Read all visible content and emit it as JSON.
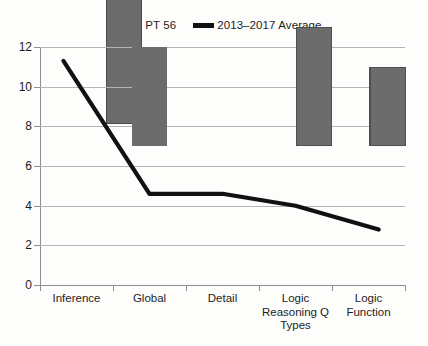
{
  "chart_data": {
    "type": "bar",
    "title": "",
    "subtitle": "",
    "xlabel": "",
    "ylabel": "",
    "categories": [
      "Inference",
      "Global",
      "Detail",
      "Logic Reasoning Q Types",
      "Logic Function"
    ],
    "ylim": [
      0,
      12
    ],
    "yticks": [
      0,
      2,
      4,
      6,
      8,
      10,
      12
    ],
    "grid": true,
    "legend_position": "top-center",
    "series": [
      {
        "name": "PT 56",
        "type": "bar",
        "color": "#6c6c6c",
        "values": [
          10,
          5,
          6,
          4,
          2
        ]
      },
      {
        "name": "2013–2017 Average",
        "type": "line",
        "color": "#111111",
        "values": [
          11.3,
          4.6,
          4.6,
          4.0,
          2.8
        ]
      }
    ]
  },
  "legend": {
    "entries": [
      {
        "label": "PT 56",
        "marker": "bar-swatch-icon",
        "color": "#6c6c6c"
      },
      {
        "label": "2013–2017 Average",
        "marker": "line-swatch-icon",
        "color": "#111111"
      }
    ]
  },
  "axes": {
    "y": {
      "tick_labels": [
        "12",
        "10",
        "8",
        "6",
        "4",
        "2",
        "0"
      ]
    },
    "x": {
      "tick_labels": [
        "Inference",
        "Global",
        "Detail",
        "Logic Reasoning Q Types",
        "Logic Function"
      ]
    }
  }
}
